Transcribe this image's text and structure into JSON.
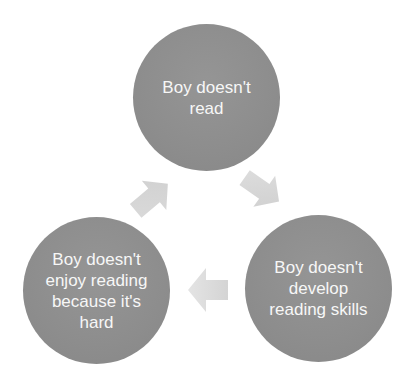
{
  "diagram": {
    "type": "cycle",
    "nodes": [
      {
        "id": "top",
        "label": "Boy doesn't read"
      },
      {
        "id": "bottom-right",
        "label": "Boy doesn't develop reading skills"
      },
      {
        "id": "bottom-left",
        "label": "Boy doesn't enjoy reading because it's hard"
      }
    ],
    "edges": [
      {
        "from": "top",
        "to": "bottom-right"
      },
      {
        "from": "bottom-right",
        "to": "bottom-left"
      },
      {
        "from": "bottom-left",
        "to": "top"
      }
    ],
    "colors": {
      "node_fill": "#8e8e8e",
      "node_text": "#f7f7f7",
      "arrow_fill": "#d9d9d9",
      "background": "#ffffff"
    }
  }
}
